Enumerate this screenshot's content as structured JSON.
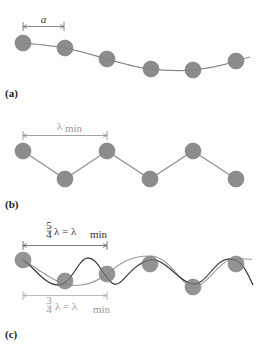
{
  "panels": [
    {
      "id": "a",
      "label": "(a)",
      "dimension": {
        "symbol": "a",
        "description": "atomic spacing"
      },
      "atoms_y": [
        43,
        48,
        59,
        69,
        70,
        61
      ]
    },
    {
      "id": "b",
      "label": "(b)",
      "dimension": {
        "symbol": "λ",
        "subscript": "min"
      },
      "atoms_y": [
        151,
        179,
        151,
        179,
        151,
        179
      ]
    },
    {
      "id": "c",
      "label": "(c)",
      "dimension_top": {
        "frac_num": "5",
        "frac_den": "4",
        "text": "λ = λ",
        "subscript": "min"
      },
      "dimension_bottom": {
        "frac_num": "3",
        "frac_den": "4",
        "text": "λ = λ",
        "subscript": "min"
      },
      "atoms_y": [
        260,
        281,
        274,
        264,
        287,
        264
      ]
    }
  ],
  "atoms_x": [
    23,
    65,
    107,
    150,
    193,
    236
  ],
  "colors": {
    "atom": "#8c8c8c",
    "line_light": "#9a9a9a",
    "line_dark": "#3a3a3a",
    "dimension_dark": "#555555",
    "dimension_grey": "#aaaaaa"
  }
}
